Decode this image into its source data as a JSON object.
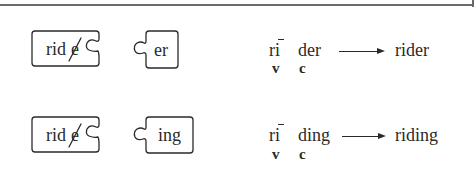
{
  "rows": [
    {
      "base_piece": {
        "text": "rid",
        "crossed_letter": "e"
      },
      "suffix_piece": {
        "text": "er"
      },
      "syllables": [
        {
          "text": "ri",
          "macron": true,
          "label": "v"
        },
        {
          "text": "der",
          "label": "c"
        }
      ],
      "result": "rider"
    },
    {
      "base_piece": {
        "text": "rid",
        "crossed_letter": "e"
      },
      "suffix_piece": {
        "text": "ing"
      },
      "syllables": [
        {
          "text": "ri",
          "macron": true,
          "label": "v"
        },
        {
          "text": "ding",
          "label": "c"
        }
      ],
      "result": "riding"
    }
  ],
  "colors": {
    "ink": "#2a2a2a",
    "rule": "#6a6a6a"
  }
}
